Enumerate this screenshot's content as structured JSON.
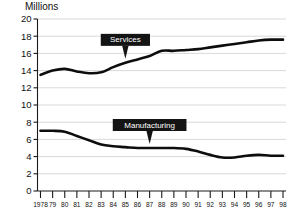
{
  "chart_data": {
    "type": "line",
    "title": "",
    "ylabel": "Millions",
    "xlabel": "",
    "ylim": [
      0,
      20
    ],
    "ytick_step": 2,
    "grid": true,
    "legend": "inline-callouts",
    "yticks": [
      "0",
      "2",
      "4",
      "6",
      "8",
      "10",
      "12",
      "14",
      "16",
      "18",
      "20"
    ],
    "categories": [
      "1978",
      "79",
      "80",
      "81",
      "82",
      "83",
      "84",
      "85",
      "86",
      "87",
      "88",
      "89",
      "90",
      "91",
      "92",
      "93",
      "94",
      "95",
      "96",
      "97",
      "98"
    ],
    "series": [
      {
        "name": "Services",
        "values": [
          13.5,
          14.0,
          14.2,
          13.9,
          13.7,
          13.8,
          14.4,
          14.9,
          15.3,
          15.7,
          16.3,
          16.3,
          16.4,
          16.5,
          16.7,
          16.9,
          17.1,
          17.3,
          17.5,
          17.6,
          17.6
        ]
      },
      {
        "name": "Manufacturing",
        "values": [
          7.0,
          7.0,
          6.9,
          6.4,
          5.9,
          5.4,
          5.2,
          5.1,
          5.0,
          5.0,
          5.0,
          5.0,
          4.9,
          4.6,
          4.2,
          3.9,
          3.9,
          4.1,
          4.2,
          4.1,
          4.1
        ]
      }
    ],
    "annotations": [
      {
        "label": "Services",
        "attach_category": "85"
      },
      {
        "label": "Manufacturing",
        "attach_category": "87"
      }
    ]
  }
}
